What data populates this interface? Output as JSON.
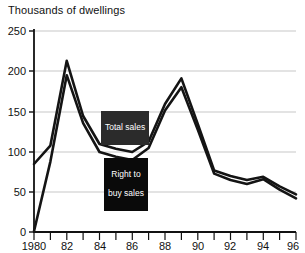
{
  "chart_data": {
    "type": "line",
    "title": "Thousands of dwellings",
    "subtitle": "",
    "xlabel": "",
    "ylabel": "",
    "xlim": [
      1980,
      1996
    ],
    "ylim": [
      0,
      250
    ],
    "grid": true,
    "legend_position": "inline-annotations",
    "x": [
      1980,
      1981,
      1982,
      1983,
      1984,
      1985,
      1986,
      1987,
      1988,
      1989,
      1990,
      1991,
      1992,
      1993,
      1994,
      1995,
      1996
    ],
    "x_tick_labels": [
      "1980",
      "82",
      "84",
      "86",
      "88",
      "90",
      "92",
      "94",
      "96"
    ],
    "x_tick_values": [
      1980,
      1982,
      1984,
      1986,
      1988,
      1990,
      1992,
      1994,
      1996
    ],
    "y_tick_labels": [
      "0",
      "50",
      "100",
      "150",
      "200",
      "250"
    ],
    "y_tick_values": [
      0,
      50,
      100,
      150,
      200,
      250
    ],
    "series": [
      {
        "name": "Total sales",
        "color": "#141414",
        "values": [
          85,
          108,
          214,
          145,
          110,
          104,
          100,
          113,
          160,
          192,
          135,
          77,
          70,
          65,
          69,
          57,
          47
        ]
      },
      {
        "name": "Right to buy sales",
        "color": "#141414",
        "values": [
          1,
          88,
          196,
          136,
          100,
          94,
          90,
          105,
          152,
          181,
          128,
          73,
          65,
          60,
          66,
          53,
          42
        ]
      }
    ],
    "annotations": [
      {
        "id": "total-sales",
        "text": "Total sales",
        "lines": [
          "Total sales"
        ],
        "target_x": 1984.6,
        "target_y": 108
      },
      {
        "id": "right-to-buy-sales",
        "text": "Right to buy sales",
        "lines": [
          "Right to",
          "buy sales"
        ],
        "target_x": 1986.0,
        "target_y": 90
      }
    ]
  },
  "axes": {
    "y_labels": [
      "250",
      "200",
      "150",
      "100",
      "50",
      "0"
    ],
    "x_labels": [
      "1980",
      "82",
      "84",
      "86",
      "88",
      "90",
      "92",
      "94",
      "96"
    ]
  },
  "annotations": {
    "total_sales": "Total sales",
    "rtb_line1": "Right to",
    "rtb_line2": "buy sales"
  }
}
